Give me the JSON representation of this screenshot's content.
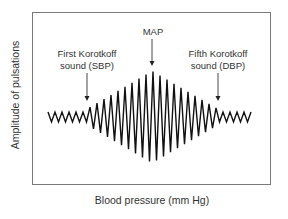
{
  "diagram": {
    "y_axis_label": "Amplitude of pulsations",
    "x_axis_label": "Blood pressure (mm Hg)",
    "annotations": {
      "sbp": {
        "line1": "First Korotkoff",
        "line2": "sound (SBP)",
        "arrow_x": 87,
        "arrow_top": 73,
        "arrow_bottom": 101
      },
      "map": {
        "label": "MAP",
        "arrow_x": 152,
        "arrow_top": 39,
        "arrow_bottom": 66
      },
      "dbp": {
        "line1": "Fifth Korotkoff",
        "line2": "sound (DBP)",
        "arrow_x": 218,
        "arrow_top": 73,
        "arrow_bottom": 101
      }
    },
    "colors": {
      "frame": "#7a7a7a",
      "wave": "#111111",
      "text": "#333333"
    }
  },
  "chart_data": {
    "type": "line",
    "title": "",
    "xlabel": "Blood pressure (mm Hg)",
    "ylabel": "Amplitude of pulsations",
    "grid": false,
    "legend": "none",
    "baseline_y": 117,
    "x_start": 48,
    "x_end": 253,
    "pre_sbp_amplitude": 5,
    "post_dbp_amplitude": 5,
    "max_amplitude_at_map": 46,
    "markers": [
      {
        "name": "First Korotkoff sound (SBP)",
        "x": 87
      },
      {
        "name": "MAP",
        "x": 152
      },
      {
        "name": "Fifth Korotkoff sound (DBP)",
        "x": 218
      }
    ],
    "period_px": 7
  }
}
